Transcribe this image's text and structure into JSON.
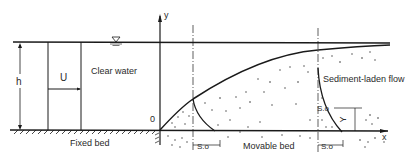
{
  "diagram": {
    "labels": {
      "y_axis": "y",
      "x_axis": "x",
      "origin": "0",
      "depth": "h",
      "velocity": "U",
      "clear_water": "Clear water",
      "fixed_bed": "Fixed bed",
      "movable_bed": "Movable bed",
      "sediment_flow": "Sediment-laden flow",
      "s0_left": "S.o",
      "s0_right": "S.o",
      "s0_vertical": "S.o",
      "Y": "Y"
    },
    "colors": {
      "line": "#1a1a1a",
      "dots": "#333333",
      "background": "#ffffff"
    }
  }
}
